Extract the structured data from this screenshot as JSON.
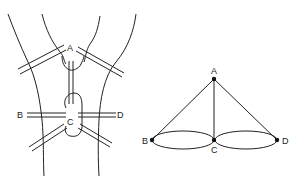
{
  "figure": {
    "title": "",
    "left_panel": {
      "description": "Map of land masses and bridges",
      "labels": {
        "A": "A",
        "B": "B",
        "C": "C",
        "D": "D"
      }
    },
    "right_panel": {
      "description": "Graph representation",
      "nodes": [
        {
          "id": "A",
          "label": "A"
        },
        {
          "id": "B",
          "label": "B"
        },
        {
          "id": "C",
          "label": "C"
        },
        {
          "id": "D",
          "label": "D"
        }
      ],
      "edges": [
        {
          "from": "A",
          "to": "B"
        },
        {
          "from": "A",
          "to": "C"
        },
        {
          "from": "A",
          "to": "D"
        },
        {
          "from": "B",
          "to": "C"
        },
        {
          "from": "B",
          "to": "C"
        },
        {
          "from": "C",
          "to": "D"
        },
        {
          "from": "C",
          "to": "D"
        }
      ]
    }
  },
  "colors": {
    "stroke": "#222222",
    "background": "#ffffff"
  }
}
